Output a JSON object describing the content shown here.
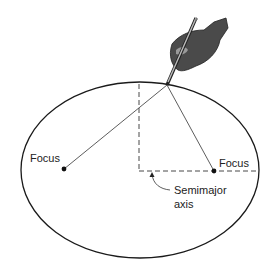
{
  "diagram": {
    "labels": {
      "focus_left": "Focus",
      "focus_right": "Focus",
      "semimajor_line1": "Semimajor",
      "semimajor_line2": "axis"
    },
    "colors": {
      "stroke": "#1a1a1a",
      "hand": "#4a4a4a",
      "background": "#ffffff"
    }
  }
}
